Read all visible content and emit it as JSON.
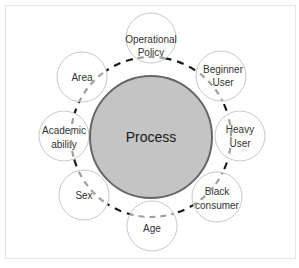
{
  "diagram": {
    "center": {
      "label": "Process",
      "fill": "#c4c4c4",
      "stroke": "#666666"
    },
    "ring": {
      "style": "dashed",
      "color": "#1a1a1a",
      "radius": 80
    },
    "nodes": [
      {
        "id": "operational-policy",
        "lines": [
          "Operational",
          "Policy"
        ]
      },
      {
        "id": "beginner-user",
        "lines": [
          "Beginner",
          "User"
        ]
      },
      {
        "id": "heavy-user",
        "lines": [
          "Heavy",
          "User"
        ]
      },
      {
        "id": "black-consumer",
        "lines": [
          "Black",
          "consumer"
        ]
      },
      {
        "id": "age",
        "lines": [
          "Age"
        ]
      },
      {
        "id": "sex",
        "lines": [
          "Sex"
        ]
      },
      {
        "id": "academic-ability",
        "lines": [
          "Academic",
          "ability"
        ]
      },
      {
        "id": "area",
        "lines": [
          "Area"
        ]
      }
    ],
    "node_stroke": "#c8c8c8",
    "inner_dash_color": "#a0a0a0"
  }
}
